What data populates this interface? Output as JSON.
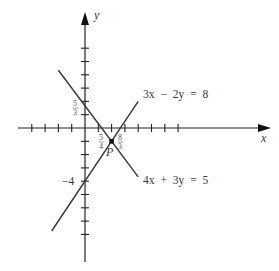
{
  "figure": {
    "type": "graph of two linear equations",
    "axes": {
      "x_label": "x",
      "y_label": "y",
      "x_ticks": [
        -4,
        -3,
        -2,
        -1,
        1,
        2,
        3,
        4,
        5,
        6,
        7
      ],
      "y_ticks": [
        6,
        5,
        4,
        3,
        2,
        1,
        -1,
        -2,
        -3,
        -4,
        -5,
        -6,
        -7,
        -8
      ]
    },
    "lines": [
      {
        "id": "line1",
        "equation": "3x − 2y = 8",
        "label_parts": [
          "3x",
          "−",
          "2y",
          "=",
          "8"
        ],
        "x_range": [
          -2.5,
          4
        ],
        "y_intercept_label": "−4",
        "x_intercept": {
          "num": "8",
          "den": "3"
        }
      },
      {
        "id": "line2",
        "equation": "4x + 3y = 5",
        "label_parts": [
          "4x",
          "+",
          "3y",
          "=",
          "5"
        ],
        "x_range": [
          -2,
          4
        ],
        "y_intercept": {
          "num": "5",
          "den": "3"
        },
        "x_intercept": {
          "num": "5",
          "den": "4"
        }
      }
    ],
    "intersection": {
      "label": "P",
      "x": 2,
      "y": -1
    },
    "colors": {
      "axis": "#222222",
      "line": "#3a3a3a",
      "text": "#3a3a3a"
    }
  }
}
